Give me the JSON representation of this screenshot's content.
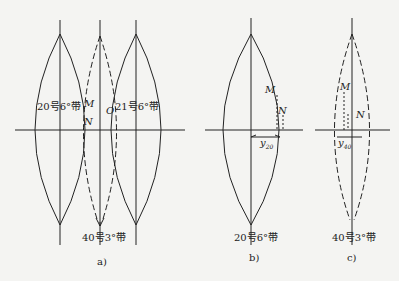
{
  "panel_a": {
    "zone_left": "20号6°带",
    "zone_right": "21号6°带",
    "zone_bottom": "40号3°带",
    "point_m": "M",
    "point_n": "N",
    "point_o": "O",
    "caption": "a)"
  },
  "panel_b": {
    "point_m": "M",
    "point_n": "N",
    "y_label": "y",
    "y_sub": "20",
    "zone_bottom": "20号6°带",
    "caption": "b)"
  },
  "panel_c": {
    "point_m": "M",
    "point_n": "N",
    "y_label": "y",
    "y_sub": "40",
    "zone_bottom": "40号3°带",
    "caption": "c)"
  }
}
